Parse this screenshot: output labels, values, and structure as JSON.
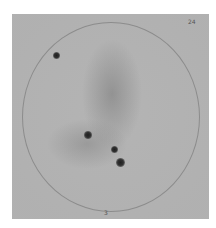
{
  "image": {
    "description": "Grayscale scan of a circular dish/plate with dark spots",
    "background_color": "#b4b4b4",
    "labels": {
      "top_right": "24",
      "bottom": "3"
    },
    "spots": [
      {
        "name": "spot-upper-left",
        "x": 44,
        "y": 41,
        "size": 5
      },
      {
        "name": "spot-center-left",
        "x": 76,
        "y": 121,
        "size": 6
      },
      {
        "name": "spot-center",
        "x": 102,
        "y": 135,
        "size": 5
      },
      {
        "name": "spot-lower-center",
        "x": 108,
        "y": 148,
        "size": 7
      }
    ]
  }
}
